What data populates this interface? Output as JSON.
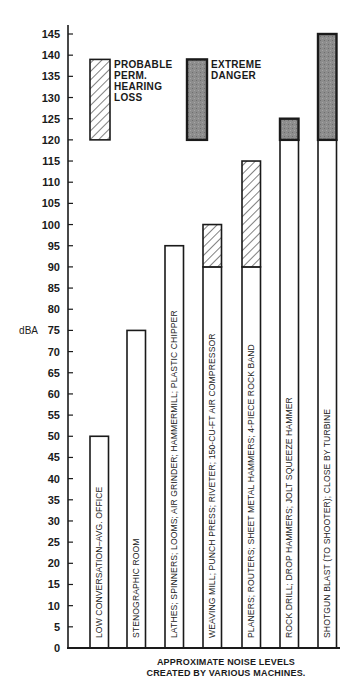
{
  "chart_data": {
    "type": "bar",
    "title": "",
    "caption": [
      "APPROXIMATE NOISE LEVELS",
      "CREATED BY VARIOUS MACHINES."
    ],
    "xlabel": "",
    "ylabel": "dBA",
    "ylim": [
      0,
      145
    ],
    "yticks": [
      0,
      5,
      10,
      15,
      20,
      25,
      30,
      35,
      40,
      45,
      50,
      55,
      60,
      65,
      70,
      75,
      80,
      85,
      90,
      95,
      100,
      105,
      110,
      115,
      120,
      125,
      130,
      135,
      140,
      145
    ],
    "grid": false,
    "legend": [
      {
        "name": "PROBABLE PERM. HEARING LOSS",
        "lines": [
          "PROBABLE",
          "PERM.",
          "HEARING",
          "LOSS"
        ],
        "style": "hatched",
        "range": [
          120,
          139
        ]
      },
      {
        "name": "EXTREME DANGER",
        "lines": [
          "EXTREME",
          "DANGER"
        ],
        "style": "dark",
        "range": [
          120,
          139
        ]
      }
    ],
    "categories": [
      "LOW CONVERSATION–AVG. OFFICE",
      "STENOGRAPHIC ROOM",
      "LATHES; SPINNERS; LOOMS; AIR GRINDER; HAMMERMILL; PLASTIC CHIPPER",
      "WEAVING MILL; PUNCH PRESS; RIVETER; 150-CU-FT AIR COMPRESSOR",
      "PLANERS; ROUTERS; SHEET METAL HAMMERS; 4-PIECE ROCK BAND",
      "ROCK DRILL; DROP HAMMERS; JOLT SQUEEZE HAMMER",
      "SHOTGUN BLAST (TO SHOOTER); CLOSE BY TURBINE"
    ],
    "bars": [
      {
        "label": "LOW CONVERSATION–AVG. OFFICE",
        "total": 50,
        "segments": [
          {
            "from": 0,
            "to": 50,
            "style": "plain"
          }
        ]
      },
      {
        "label": "STENOGRAPHIC ROOM",
        "total": 75,
        "segments": [
          {
            "from": 0,
            "to": 75,
            "style": "plain"
          }
        ]
      },
      {
        "label": "LATHES; SPINNERS; LOOMS; AIR GRINDER; HAMMERMILL; PLASTIC CHIPPER",
        "total": 95,
        "segments": [
          {
            "from": 0,
            "to": 95,
            "style": "plain"
          }
        ]
      },
      {
        "label": "WEAVING MILL; PUNCH PRESS; RIVETER; 150-CU-FT AIR COMPRESSOR",
        "total": 100,
        "segments": [
          {
            "from": 0,
            "to": 90,
            "style": "plain"
          },
          {
            "from": 90,
            "to": 100,
            "style": "hatched"
          }
        ]
      },
      {
        "label": "PLANERS; ROUTERS; SHEET METAL HAMMERS; 4-PIECE ROCK BAND",
        "total": 115,
        "segments": [
          {
            "from": 0,
            "to": 90,
            "style": "plain"
          },
          {
            "from": 90,
            "to": 115,
            "style": "hatched"
          }
        ]
      },
      {
        "label": "ROCK DRILL; DROP HAMMERS; JOLT SQUEEZE HAMMER",
        "total": 125,
        "segments": [
          {
            "from": 0,
            "to": 120,
            "style": "plain"
          },
          {
            "from": 120,
            "to": 125,
            "style": "dark"
          }
        ]
      },
      {
        "label": "SHOTGUN BLAST (TO SHOOTER); CLOSE BY TURBINE",
        "total": 145,
        "segments": [
          {
            "from": 0,
            "to": 120,
            "style": "plain"
          },
          {
            "from": 120,
            "to": 145,
            "style": "dark"
          }
        ]
      }
    ],
    "values": [
      50,
      75,
      95,
      100,
      115,
      125,
      145
    ],
    "series": [
      {
        "name": "Normal",
        "values": [
          50,
          75,
          95,
          90,
          90,
          120,
          120
        ]
      },
      {
        "name": "PROBABLE PERM. HEARING LOSS",
        "values": [
          0,
          0,
          0,
          10,
          25,
          0,
          0
        ]
      },
      {
        "name": "EXTREME DANGER",
        "values": [
          0,
          0,
          0,
          0,
          0,
          5,
          25
        ]
      }
    ],
    "colors": {
      "ink": "#1a1a1a",
      "dark_fill": "#8a8a8a",
      "background": "#ffffff"
    }
  }
}
